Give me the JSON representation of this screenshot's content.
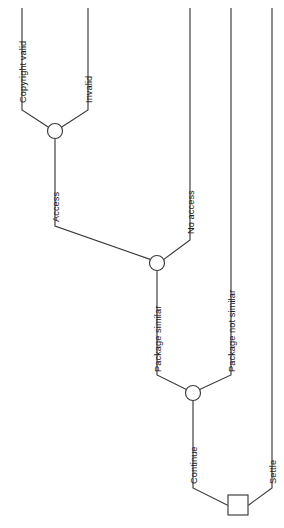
{
  "diagram": {
    "type": "decision-tree",
    "orientation": "rotated-90-counterclockwise",
    "stroke_color": "#3a3a3a",
    "background_color": "#ffffff",
    "text_color": "#1c1c1c",
    "nodes": [
      {
        "id": "n1",
        "shape": "circle",
        "cx": 55,
        "cy": 131,
        "r": 7.5
      },
      {
        "id": "n2",
        "shape": "circle",
        "cx": 157,
        "cy": 263,
        "r": 7.5
      },
      {
        "id": "n3",
        "shape": "circle",
        "cx": 193,
        "cy": 393,
        "r": 7.5
      },
      {
        "id": "n4",
        "shape": "square",
        "x": 228,
        "y": 495,
        "w": 20,
        "h": 20
      }
    ],
    "labels": [
      {
        "id": "lbl-copyright-valid",
        "text": "Copyright valid",
        "x": 19,
        "y": 103,
        "rotation": -90
      },
      {
        "id": "lbl-invalid",
        "text": "Invalid",
        "x": 85,
        "y": 103,
        "rotation": -90
      },
      {
        "id": "lbl-access",
        "text": "Access",
        "x": 52,
        "y": 222,
        "rotation": -90
      },
      {
        "id": "lbl-no-access",
        "text": "No access",
        "x": 187,
        "y": 234,
        "rotation": -90
      },
      {
        "id": "lbl-package-similar",
        "text": "Package similar",
        "x": 154,
        "y": 372,
        "rotation": -90
      },
      {
        "id": "lbl-package-not-similar",
        "text": "Package not similar",
        "x": 228,
        "y": 372,
        "rotation": -90
      },
      {
        "id": "lbl-continue",
        "text": "Continue",
        "x": 190,
        "y": 484,
        "rotation": -90
      },
      {
        "id": "lbl-settle",
        "text": "Settle",
        "x": 269,
        "y": 484,
        "rotation": -90
      }
    ],
    "edges": [
      {
        "id": "edge-copyright-valid",
        "from": "branch-top-left",
        "to": "n1",
        "path": "M22,8 L22,110 L48.5,127"
      },
      {
        "id": "edge-invalid",
        "from": "branch-top-right",
        "to": "n1",
        "path": "M88,8 L88,110 L61.5,127"
      },
      {
        "id": "edge-access",
        "from": "n1",
        "to": "n2",
        "path": "M55,138.5 L55,226 L150,259"
      },
      {
        "id": "edge-no-access",
        "from": "branch-no-access",
        "to": "n2",
        "path": "M190,8 L190,240 L164,259"
      },
      {
        "id": "edge-package-similar",
        "from": "n2",
        "to": "n3",
        "path": "M157,270.5 L157,375 L186.5,389"
      },
      {
        "id": "edge-package-not-similar",
        "from": "branch-pns",
        "to": "n3",
        "path": "M231,8 L231,375 L199.5,389"
      },
      {
        "id": "edge-continue",
        "from": "n3",
        "to": "n4",
        "path": "M193,400.5 L193,488 L228,505"
      },
      {
        "id": "edge-settle",
        "from": "branch-settle",
        "to": "n4",
        "path": "M272,8 L272,488 L248,505"
      }
    ]
  }
}
